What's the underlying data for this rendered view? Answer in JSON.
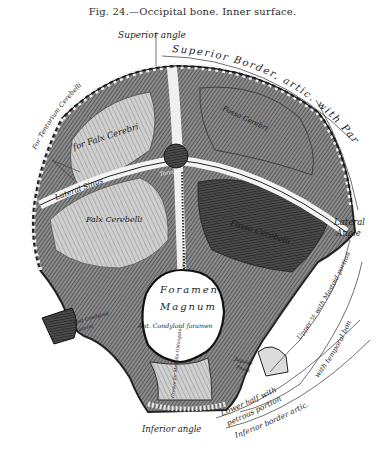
{
  "caption": "Fig. 24.—Occipital bone.  Inner surface.",
  "colors": {
    "background": "#ffffff",
    "ink": "#1e1e1e",
    "bone_dark": "#3a3a3a",
    "bone_mid": "#6e6e6e",
    "bone_light": "#b8b8b8",
    "foramen": "#ffffff"
  },
  "labels": {
    "superior_angle": "Superior angle",
    "superior_border": "Superior Border, artic. with Parietal bone",
    "for_tentorium": "For Tentorium Cerebelli",
    "for_falx_cerebri": "for Falx Cerebri",
    "lateral_sinus": "Lateral Sinus",
    "torcular": "Torcular",
    "fossa_cerebri": "Fossa Cerebri",
    "falx_cerebelli": "Falx Cerebelli",
    "crista": "Crista",
    "fossa_cerebelli": "Fossa Cerebelli",
    "lateral_angle_1": "Lateral",
    "lateral_angle_2": "Angle",
    "upper_half_mastoid": "Upper ½ with Mastoid portion",
    "foramen": "Foramen",
    "magnum": "Magnum",
    "ant_condyloid": "Ant. Condyloid foramen",
    "post_condyloid": "Post Condyloid",
    "lateral_small": "Lateral",
    "jugular_fossa_1": "Jugular",
    "jugular_fossa_2": "Fossa",
    "groove_medulla": "Groove for Medulla Oblongata",
    "lower_half_1": "Lower half with",
    "lower_half_2": "petrous portion",
    "inferior_border": "Inferior border artic.",
    "with_temporal": "with temporal bone",
    "inferior_angle": "Inferior angle"
  }
}
